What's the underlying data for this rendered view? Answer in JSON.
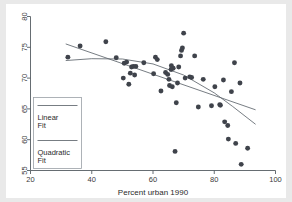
{
  "figure": {
    "background_color": "#e9e9e9",
    "plot_background_color": "#ffffff",
    "marker_color": "#3f434b",
    "line_color": "#5f666d",
    "axis_color": "#555c62"
  },
  "legend": {
    "items": [
      {
        "label_line1": "Linear",
        "label_line2": "Fit",
        "name": "linear-fit"
      },
      {
        "label_line1": "Quadratic",
        "label_line2": "Fit",
        "name": "quadratic-fit"
      }
    ]
  },
  "chart_data": {
    "type": "scatter",
    "title": "",
    "subtitle": "",
    "xlabel": "Percent urban 1990",
    "ylabel": "",
    "xlim": [
      20,
      100
    ],
    "ylim": [
      55,
      80
    ],
    "xticks": [
      20,
      40,
      60,
      80,
      100
    ],
    "yticks": [
      55,
      60,
      65,
      70,
      75,
      80
    ],
    "xtick_labels": [
      "20",
      "40",
      "60",
      "80",
      "100"
    ],
    "ytick_labels": [
      "55",
      "60",
      "65",
      "70",
      "75",
      "80"
    ],
    "grid": false,
    "legend_position": "lower-left",
    "marker": "filled-circle",
    "points": [
      {
        "x": 32.2,
        "y": 73.4
      },
      {
        "x": 36.2,
        "y": 75.2
      },
      {
        "x": 44.6,
        "y": 75.9
      },
      {
        "x": 48.0,
        "y": 73.3
      },
      {
        "x": 50.3,
        "y": 70.0
      },
      {
        "x": 50.6,
        "y": 72.4
      },
      {
        "x": 51.4,
        "y": 72.6
      },
      {
        "x": 52.1,
        "y": 69.0
      },
      {
        "x": 52.6,
        "y": 70.8
      },
      {
        "x": 53.0,
        "y": 71.8
      },
      {
        "x": 53.6,
        "y": 71.9
      },
      {
        "x": 54.0,
        "y": 70.5
      },
      {
        "x": 54.4,
        "y": 71.9
      },
      {
        "x": 57.0,
        "y": 72.5
      },
      {
        "x": 60.2,
        "y": 70.7
      },
      {
        "x": 60.8,
        "y": 73.4
      },
      {
        "x": 61.4,
        "y": 73.0
      },
      {
        "x": 62.6,
        "y": 67.9
      },
      {
        "x": 64.1,
        "y": 70.9
      },
      {
        "x": 64.8,
        "y": 70.6
      },
      {
        "x": 65.2,
        "y": 69.8
      },
      {
        "x": 65.4,
        "y": 68.8
      },
      {
        "x": 65.9,
        "y": 71.4
      },
      {
        "x": 66.0,
        "y": 72.0
      },
      {
        "x": 66.3,
        "y": 68.6
      },
      {
        "x": 66.6,
        "y": 71.6
      },
      {
        "x": 67.2,
        "y": 58.1
      },
      {
        "x": 67.6,
        "y": 66.0
      },
      {
        "x": 68.0,
        "y": 69.2
      },
      {
        "x": 68.4,
        "y": 71.8
      },
      {
        "x": 69.0,
        "y": 73.6
      },
      {
        "x": 69.3,
        "y": 74.5
      },
      {
        "x": 69.6,
        "y": 74.9
      },
      {
        "x": 70.0,
        "y": 77.3
      },
      {
        "x": 70.5,
        "y": 70.0
      },
      {
        "x": 72.0,
        "y": 70.2
      },
      {
        "x": 72.6,
        "y": 70.1
      },
      {
        "x": 73.6,
        "y": 73.6
      },
      {
        "x": 74.8,
        "y": 65.3
      },
      {
        "x": 76.4,
        "y": 69.8
      },
      {
        "x": 79.1,
        "y": 65.5
      },
      {
        "x": 80.2,
        "y": 68.6
      },
      {
        "x": 81.8,
        "y": 65.7
      },
      {
        "x": 82.0,
        "y": 65.6
      },
      {
        "x": 83.0,
        "y": 69.7
      },
      {
        "x": 83.4,
        "y": 62.9
      },
      {
        "x": 84.4,
        "y": 62.3
      },
      {
        "x": 84.6,
        "y": 60.1
      },
      {
        "x": 85.6,
        "y": 67.8
      },
      {
        "x": 86.6,
        "y": 72.5
      },
      {
        "x": 87.0,
        "y": 59.4
      },
      {
        "x": 88.4,
        "y": 69.2
      },
      {
        "x": 88.8,
        "y": 56.0
      },
      {
        "x": 90.9,
        "y": 58.6
      }
    ],
    "series": [
      {
        "name": "Linear Fit",
        "type": "line",
        "x": [
          31.5,
          93.5
        ],
        "y": [
          75.55,
          64.85
        ]
      },
      {
        "name": "Quadratic Fit",
        "type": "line",
        "x": [
          31.5,
          40.0,
          50.0,
          60.0,
          70.0,
          80.0,
          86.0,
          93.5
        ],
        "y": [
          72.85,
          73.15,
          73.1,
          72.3,
          70.5,
          67.6,
          65.4,
          62.5
        ]
      }
    ]
  }
}
